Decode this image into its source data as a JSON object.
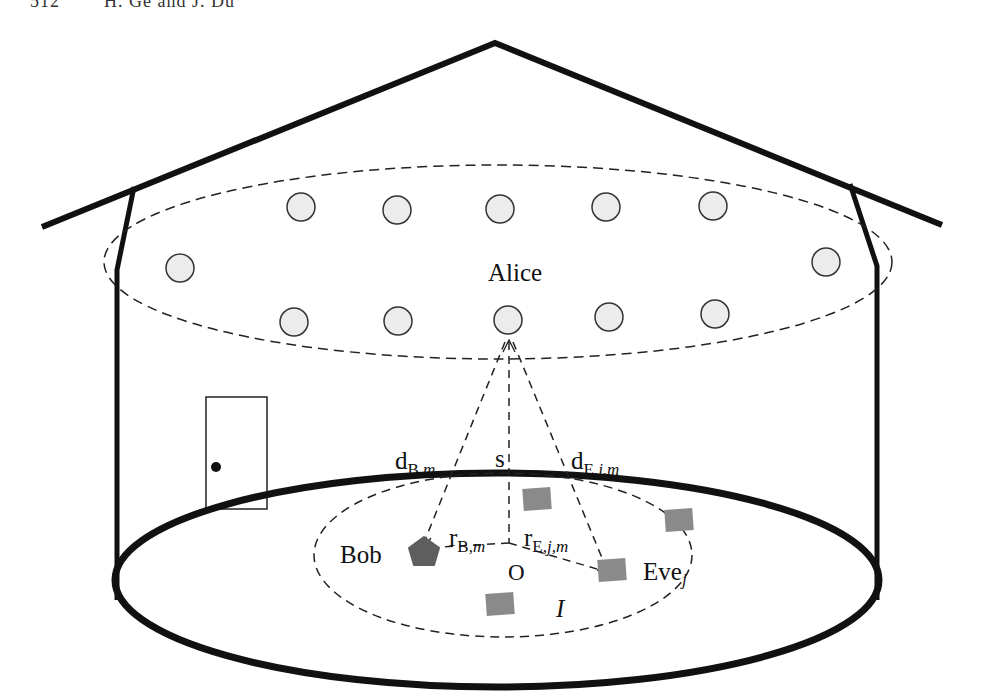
{
  "header": {
    "text": "512        H. Ge and J. Du"
  },
  "diagram": {
    "type": "indoor VLC secure transmission scenario",
    "labels": {
      "alice": "Alice",
      "bob": "Bob",
      "eve": "Eve",
      "eve_sub": "j",
      "origin": "O",
      "region": "I",
      "s": "s",
      "d_bob_main": "d",
      "d_bob_sub": "B,",
      "d_bob_sub2": "m",
      "d_eve_main": "d",
      "d_eve_sub": "E,",
      "d_eve_sub2": "j,m",
      "r_bob_main": "r",
      "r_bob_sub": "B,",
      "r_bob_sub2": "m",
      "r_eve_main": "r",
      "r_eve_sub": "E,",
      "r_eve_sub2": "j,m"
    },
    "leds": {
      "count": 12,
      "positions": [
        [
          180,
          268
        ],
        [
          301,
          207
        ],
        [
          397,
          210
        ],
        [
          500,
          209
        ],
        [
          606,
          207
        ],
        [
          713,
          206
        ],
        [
          826,
          262
        ],
        [
          294,
          322
        ],
        [
          398,
          321
        ],
        [
          508,
          320
        ],
        [
          609,
          317
        ],
        [
          715,
          314
        ]
      ],
      "selected_index": 9
    },
    "eavesdroppers": {
      "positions": [
        [
          537,
          499
        ],
        [
          679,
          520
        ],
        [
          612,
          570
        ],
        [
          500,
          604
        ]
      ],
      "target_index": 2
    },
    "colors": {
      "stroke": "#111111",
      "led_fill": "#ececec",
      "eve_fill": "#8a8a8a",
      "bob_fill": "#5e5e5e"
    }
  }
}
